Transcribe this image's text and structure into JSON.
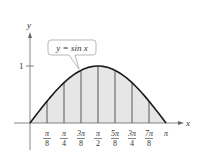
{
  "chart_data": {
    "type": "area",
    "title": "",
    "function_label": "y = sin x",
    "xlabel": "x",
    "ylabel": "y",
    "xlim": [
      0,
      3.14159
    ],
    "ylim": [
      0,
      1
    ],
    "y_ticks": [
      {
        "value": 1,
        "label": "1"
      }
    ],
    "x_ticks": [
      {
        "value": 0.3927,
        "num": "π",
        "den": "8"
      },
      {
        "value": 0.7854,
        "num": "π",
        "den": "4"
      },
      {
        "value": 1.1781,
        "num": "3π",
        "den": "8"
      },
      {
        "value": 1.5708,
        "num": "π",
        "den": "2"
      },
      {
        "value": 1.9635,
        "num": "5π",
        "den": "8"
      },
      {
        "value": 2.3562,
        "num": "3π",
        "den": "4"
      },
      {
        "value": 2.7489,
        "num": "7π",
        "den": "8"
      },
      {
        "value": 3.1416,
        "label": "π"
      }
    ],
    "shaded_region": "area under y = sin x from 0 to π, partitioned into 8 subintervals",
    "grid": false,
    "legend": "none",
    "colors": {
      "curve": "#1a1a1a",
      "fill": "#e6e6e6",
      "axis": "#555555",
      "partition": "#333333"
    }
  }
}
